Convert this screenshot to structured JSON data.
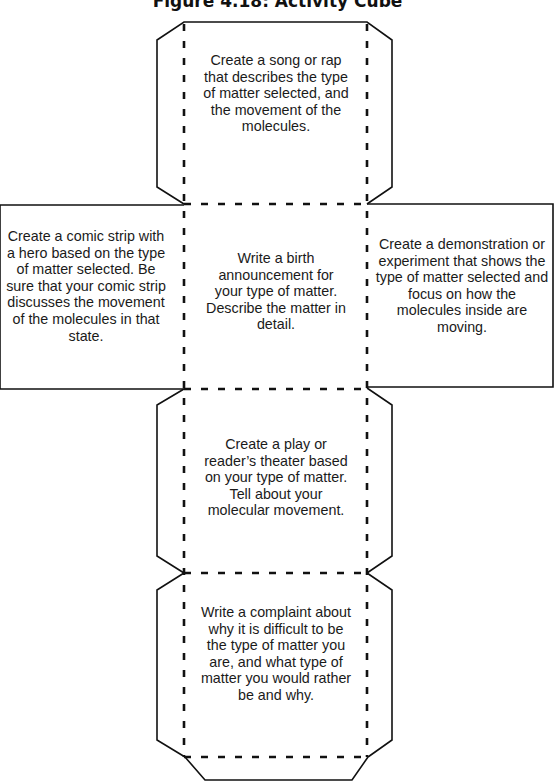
{
  "title": "Figure 4.18: Activity Cube",
  "colors": {
    "line": "#111111",
    "text": "#1a1a1a",
    "background": "#ffffff"
  },
  "faces": {
    "top": {
      "text": "Create a song or rap that describes the type of matter selected, and the movement of the molecules."
    },
    "left": {
      "text": "Create a comic strip with a hero based on the type of matter selected. Be sure that your comic strip discusses the movement of the molecules in that state."
    },
    "center": {
      "text": "Write a birth announcement for your type of matter. Describe the matter in detail."
    },
    "right": {
      "text": "Create a demonstration or experiment that shows the type of matter selected and focus on how the molecules inside are moving."
    },
    "lower": {
      "text": "Create a play or reader’s theater based on your type of matter. Tell about your molecular movement."
    },
    "bottom": {
      "text": "Write a complaint about why it is difficult to be the type of matter you are, and what type of matter you would rather be and why."
    }
  }
}
